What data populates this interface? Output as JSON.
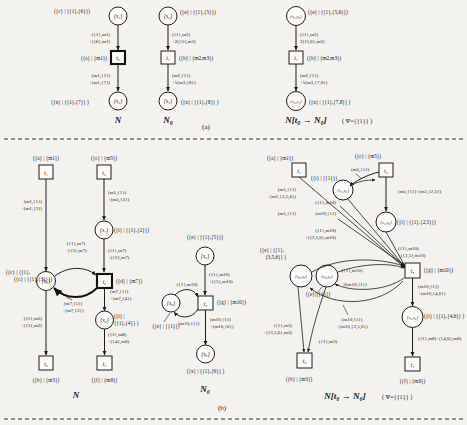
{
  "figure": {
    "panel_a_caption": "(a)",
    "panel_b_caption": "(b)"
  },
  "panel_a": {
    "net_N": {
      "caption": "N",
      "places": [
        {
          "id": "s1",
          "name": "{s₁}",
          "label": "({c} | {{1},{6}})"
        },
        {
          "id": "s2",
          "name": "{s₂}",
          "label": "({x} | {{1},{7}} )"
        }
      ],
      "transitions": [
        {
          "id": "t0",
          "name": "t₀",
          "label": "({a} | {m1})",
          "substituted": true
        }
      ],
      "arcs": [
        {
          "from": "s1",
          "to": "t0",
          "label": "({1},m1)\n+({6},m1)"
        },
        {
          "from": "t0",
          "to": "s2",
          "label": "(m1,{1})\n+(m1,{7})"
        }
      ]
    },
    "net_N0": {
      "caption": "N₀",
      "places": [
        {
          "id": "s3",
          "name": "{s₃}",
          "label": "({e} | {{1},{5}})"
        },
        {
          "id": "s4",
          "name": "{s₄}",
          "label": "({x} | {{1},{8}} )"
        }
      ],
      "transitions": [
        {
          "id": "t1",
          "name": "t₁",
          "label": "({b} | {m2,m3})",
          "substituted": false
        }
      ],
      "arcs": [
        {
          "from": "s3",
          "to": "t1",
          "label": "({1},m2)\n+2({5},m3)"
        },
        {
          "from": "t1",
          "to": "s4",
          "label": "(m2,{1})\n+5(m3,{8})"
        }
      ]
    },
    "net_sub": {
      "caption": "N[t₀ → N₀]",
      "psi": "( Ψ={{1}} )",
      "places": [
        {
          "id": "s1s3",
          "name": "{s₁,s₃}",
          "label": "({e} | {{1},{5,6}})"
        },
        {
          "id": "s2s4",
          "name": "{s₂,s₄}",
          "label": "({x} | {{1},{7,8}} )"
        }
      ],
      "transitions": [
        {
          "id": "t1",
          "name": "t₁",
          "label": "({b} | {m2,m3})",
          "substituted": false
        }
      ],
      "arcs": [
        {
          "from": "s1s3",
          "to": "t1",
          "label": "({1},m2)\n2({5,6},m3)"
        },
        {
          "from": "t1",
          "to": "s2s4",
          "label": "(m2,{1})\n+5(m3,{7,8})"
        }
      ]
    }
  },
  "panel_b": {
    "net_N": {
      "caption": "N",
      "places": [
        {
          "id": "s1",
          "name": "{s₁}",
          "label": "({i} | {{1},{2}})"
        },
        {
          "id": "s3",
          "name": "{s₃}",
          "label": "({c} | {{1},{3}}})"
        },
        {
          "id": "s2",
          "name": "{s₂}",
          "label": "({i} | {{1},{4}} )"
        }
      ],
      "transitions": [
        {
          "id": "t1",
          "name": "t₁",
          "label": "({a} | {m1})",
          "substituted": false
        },
        {
          "id": "t2",
          "name": "t₂",
          "label": "({c} | {m5})",
          "substituted": false
        },
        {
          "id": "t0",
          "name": "t₀",
          "label": "({d} | {m7})",
          "substituted": true
        },
        {
          "id": "t3",
          "name": "t₃",
          "label": "({b} | {m3})",
          "substituted": false
        },
        {
          "id": "t4",
          "name": "t₄",
          "label": "({f} | {m8})",
          "substituted": false
        }
      ],
      "arcs": [
        {
          "from": "t1",
          "to": "s3",
          "label": "(m1,{1})\n+(m1,{3})"
        },
        {
          "from": "t2",
          "to": "s1",
          "label": "(m5,{1})\n+(m5,{2})"
        },
        {
          "from": "s1",
          "to": "t0",
          "label": "({1},m7)\n+({2},m7)"
        },
        {
          "from": "s3",
          "to": "t0",
          "label": "({1},m7)\n+({3},m7)"
        },
        {
          "from": "t0",
          "to": "s3",
          "label": "(m7,{1})\n+(m7,{3})"
        },
        {
          "from": "t0",
          "to": "s2",
          "label": "(m7,{1})\n+(m7,{4})"
        },
        {
          "from": "s3",
          "to": "t3",
          "label": "({1},m3)\n+({3},m3)"
        },
        {
          "from": "s2",
          "to": "t4",
          "label": "({1},m8)\n+({4},m8)"
        }
      ]
    },
    "net_N0": {
      "caption": "N₀",
      "places": [
        {
          "id": "s6",
          "name": "{s₆}",
          "label": "({e} | {{1},{5}})"
        },
        {
          "id": "s8",
          "name": "{s₈}",
          "label": "({e} | {{1}})"
        },
        {
          "id": "s9",
          "name": "{s₉}",
          "label": "({x} | {{1},{6}} )"
        }
      ],
      "transitions": [
        {
          "id": "t5",
          "name": "t₅",
          "label": "({g} | {m10})",
          "substituted": false
        }
      ],
      "arcs": [
        {
          "from": "s6",
          "to": "t5",
          "label": "({1},m10)\n+({5},m10)"
        },
        {
          "from": "s8",
          "to": "t5",
          "label": "({1},m10)"
        },
        {
          "from": "t5",
          "to": "s8",
          "label": "(m10,{1})"
        },
        {
          "from": "t5",
          "to": "s9",
          "label": "(m10,{1})\n+(m10,{6})"
        }
      ]
    },
    "net_sub": {
      "caption": "N[t₀ → N₀]",
      "psi": "( Ψ={{1}} )",
      "places": [
        {
          "id": "s1s6",
          "name": "{s₁,s₆}",
          "label": "({i} | {{1}})"
        },
        {
          "id": "s1s6b",
          "name": "{s₁,s₆}",
          "label": "({i} | {{1},{2,5}})"
        },
        {
          "id": "s3s8a",
          "name": "{s₃,s₈}",
          "label": "({e}|{{1}})"
        },
        {
          "id": "s3s8b",
          "name": "{s₃,s₈}",
          "label": "({e} | {{1},{3,5,6}} )"
        },
        {
          "id": "s2s9",
          "name": "{s₂,s₉}",
          "label": "({i} | {{1},{4,6}} )"
        }
      ],
      "transitions": [
        {
          "id": "t1",
          "name": "t₁",
          "label": "({a} | {m1})",
          "substituted": false
        },
        {
          "id": "t2",
          "name": "t₂",
          "label": "({c} | {m5})",
          "substituted": false
        },
        {
          "id": "t5",
          "name": "t₅",
          "label": "({g} | {m10})",
          "substituted": false
        },
        {
          "id": "t3",
          "name": "t₃",
          "label": "({b} | {m3})",
          "substituted": false
        },
        {
          "id": "t4",
          "name": "t₄",
          "label": "({f} | {m8})",
          "substituted": false
        }
      ],
      "arcs": [
        {
          "from": "t1",
          "to": "s3s8b",
          "label": "(m1,{1})\n+(m1,{3,5,6})"
        },
        {
          "from": "t1b",
          "to": "s3s8b",
          "label": "(m1,{1})"
        },
        {
          "from": "t2",
          "to": "s1s6",
          "label": "(m5,{1})"
        },
        {
          "from": "t2",
          "to": "s1s6b",
          "label": "(m5,{1})+(m5,{2,5})"
        },
        {
          "from": "s1s6",
          "to": "t5",
          "label": "({1},m10)"
        },
        {
          "from": "s1s6",
          "to": "t5b",
          "label": "(m10,{1})"
        },
        {
          "from": "s1s6b",
          "to": "t5",
          "label": "({1},m10)\n+({2,5},m10)"
        },
        {
          "from": "s3s8b",
          "to": "t5",
          "label": "({1},m10)\n+({3,5,6},m10)"
        },
        {
          "from": "s3s8a",
          "to": "t5",
          "label": "({1},m10)"
        },
        {
          "from": "t5",
          "to": "s3s8a",
          "label": "2(m10,{1})"
        },
        {
          "from": "t5",
          "to": "s3s8b",
          "label": "(m10,{1})\n+(m10,{3,5,6})"
        },
        {
          "from": "t5",
          "to": "s2s9",
          "label": "(m10,{1})\n+(m10,{4,6})"
        },
        {
          "from": "s3s8",
          "to": "t3",
          "label": "({1},m3)\n+({3,5,6},m3)"
        },
        {
          "from": "s3s8b",
          "to": "t3",
          "label": "({1},m3)"
        },
        {
          "from": "s2s9",
          "to": "t4",
          "label": "({1},m8)+({4,6},m8)"
        }
      ]
    }
  }
}
